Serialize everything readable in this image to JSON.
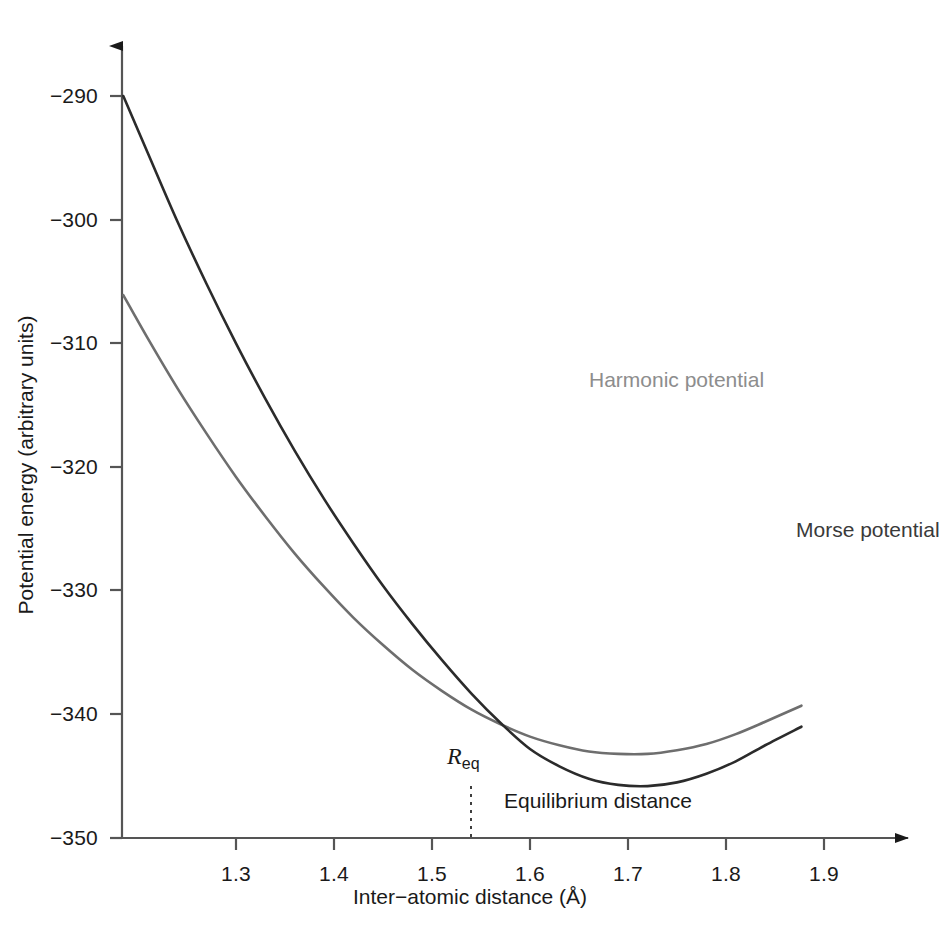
{
  "chart_data": {
    "type": "line",
    "title": "",
    "xlabel": "Inter−atomic distance (Å)",
    "ylabel": "Potential energy (arbitrary units)",
    "xlim": [
      1.185,
      1.95
    ],
    "ylim": [
      -350,
      -285
    ],
    "xticks": [
      1.3,
      1.4,
      1.5,
      1.6,
      1.7,
      1.8,
      1.9
    ],
    "xtick_labels": [
      "1.3",
      "1.4",
      "1.5",
      "1.6",
      "1.7",
      "1.8",
      "1.9"
    ],
    "yticks": [
      -290,
      -300,
      -310,
      -320,
      -330,
      -340,
      -350
    ],
    "ytick_labels": [
      "−290",
      "−300",
      "−310",
      "−320",
      "−330",
      "−340",
      "−350"
    ],
    "grid": false,
    "legend_position": "inline-annotations",
    "equilibrium_distance": 1.54,
    "well_minimum_energy": -345.8,
    "series": [
      {
        "name": "Morse potential",
        "color": "#2b2b2b",
        "label_text": "Morse potential",
        "x": [
          1.185,
          1.21,
          1.24,
          1.27,
          1.3,
          1.33,
          1.36,
          1.39,
          1.42,
          1.45,
          1.48,
          1.51,
          1.54,
          1.57,
          1.6,
          1.63,
          1.66,
          1.69,
          1.72,
          1.75,
          1.78,
          1.81,
          1.84,
          1.877
        ],
        "y": [
          -290.0,
          -294.6,
          -300.1,
          -305.2,
          -310.0,
          -314.5,
          -318.7,
          -322.6,
          -326.2,
          -329.6,
          -332.7,
          -335.6,
          -338.3,
          -340.7,
          -342.8,
          -344.2,
          -345.2,
          -345.7,
          -345.8,
          -345.5,
          -344.8,
          -343.8,
          -342.5,
          -341.0
        ]
      },
      {
        "name": "Harmonic potential",
        "color": "#6e6e6e",
        "label_text": "Harmonic potential",
        "x": [
          1.185,
          1.21,
          1.24,
          1.27,
          1.3,
          1.33,
          1.36,
          1.39,
          1.42,
          1.45,
          1.48,
          1.51,
          1.54,
          1.57,
          1.6,
          1.63,
          1.66,
          1.69,
          1.72,
          1.75,
          1.78,
          1.81,
          1.84,
          1.877
        ],
        "y": [
          -306.1,
          -309.6,
          -313.6,
          -317.3,
          -320.8,
          -324.0,
          -327.0,
          -329.7,
          -332.2,
          -334.4,
          -336.4,
          -338.1,
          -339.6,
          -340.8,
          -341.8,
          -342.5,
          -343.0,
          -343.2,
          -343.2,
          -342.9,
          -342.4,
          -341.6,
          -340.6,
          -339.3
        ]
      }
    ],
    "annotations": [
      {
        "name": "req-marker",
        "text": "R",
        "subscript": "eq",
        "x": 1.54
      },
      {
        "name": "equilibrium-distance-note",
        "text": "Equilibrium distance",
        "x": 1.6
      }
    ]
  },
  "labels": {
    "x_axis_title": "Inter−atomic distance (Å)",
    "y_axis_title": "Potential energy (arbitrary units)",
    "harmonic_curve": "Harmonic potential",
    "morse_curve": "Morse potential",
    "req_symbol": "R",
    "req_subscript": "eq",
    "equilibrium_distance": "Equilibrium distance"
  },
  "colors": {
    "morse": "#2b2b2b",
    "harmonic": "#6e6e6e",
    "axis": "#4a4a4a",
    "text": "#1a1a1a",
    "background": "#ffffff"
  }
}
